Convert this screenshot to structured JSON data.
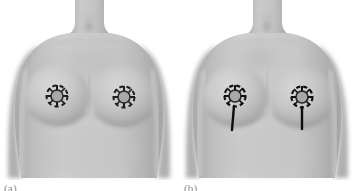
{
  "figure": {
    "background_color": "#ffffff",
    "skin_base_color": "#b9b9b9",
    "skin_light_color": "#d2d2d2",
    "skin_shadow_color": "#9a9a9a",
    "marking_color": "#1a1a1a",
    "panel_count": 2
  },
  "panels": [
    {
      "id": "a",
      "caption": "(a)",
      "description": "Frontal view of female torso with circular periareolar markings on both breasts",
      "marking_type": "periareolar-circle",
      "has_vertical_limb": false,
      "markings": [
        {
          "side": "right-breast",
          "cx": 57,
          "cy": 96,
          "outer_r": 11,
          "inner_r": 6,
          "tick_count": 8
        },
        {
          "side": "left-breast",
          "cx": 124,
          "cy": 97,
          "outer_r": 11,
          "inner_r": 6,
          "tick_count": 8
        }
      ]
    },
    {
      "id": "b",
      "caption": "(b)",
      "description": "Frontal view of female torso with periareolar markings plus vertical limb extending inferiorly",
      "marking_type": "keyhole-vertical-scar",
      "has_vertical_limb": true,
      "markings": [
        {
          "side": "right-breast",
          "cx": 57,
          "cy": 96,
          "outer_r": 11,
          "inner_r": 6,
          "tick_count": 8,
          "limb_length": 26
        },
        {
          "side": "left-breast",
          "cx": 124,
          "cy": 97,
          "outer_r": 11,
          "inner_r": 6,
          "tick_count": 8,
          "limb_length": 24
        }
      ]
    }
  ],
  "anatomy_labels": {
    "neck": "neck",
    "clavicle": "clavicle",
    "sternal-notch": "sternal notch",
    "right-breast": "right breast",
    "left-breast": "left breast",
    "right-arm": "right arm",
    "left-arm": "left arm",
    "abdomen": "abdomen"
  }
}
